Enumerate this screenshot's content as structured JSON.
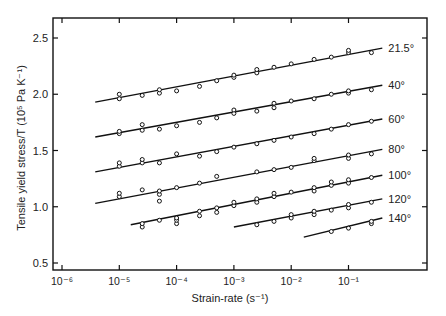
{
  "chart_data": {
    "type": "line",
    "title": "",
    "xlabel": "Strain-rate (s⁻¹)",
    "ylabel": "Tensile yield stress/T (10⁵ Pa K⁻¹)",
    "xscale": "log",
    "xlim_log10": [
      -6.0,
      0.38
    ],
    "ylim": [
      0.45,
      2.67
    ],
    "x_ticks_log10": [
      -6,
      -5,
      -4,
      -3,
      -2,
      -1
    ],
    "x_tick_labels": [
      "10⁻⁶",
      "10⁻⁵",
      "10⁻⁴",
      "10⁻³",
      "10⁻²",
      "10⁻¹"
    ],
    "y_ticks": [
      0.5,
      1.0,
      1.5,
      2.0,
      2.5
    ],
    "y_tick_labels": [
      "0.5",
      "1.0",
      "1.5",
      "2.0",
      "2.5"
    ],
    "grid": false,
    "legend_position": "inline labels at right end of each line",
    "series": [
      {
        "name": "21.5°",
        "fit_line": {
          "x_log10": [
            -5.42,
            -0.41
          ],
          "y": [
            1.93,
            2.41
          ]
        },
        "points": [
          [
            -5.0,
            1.96
          ],
          [
            -5.0,
            2.0
          ],
          [
            -4.6,
            1.99
          ],
          [
            -4.3,
            2.01
          ],
          [
            -4.3,
            2.04
          ],
          [
            -4.0,
            2.03
          ],
          [
            -3.6,
            2.07
          ],
          [
            -3.3,
            2.12
          ],
          [
            -3.0,
            2.15
          ],
          [
            -3.0,
            2.17
          ],
          [
            -2.6,
            2.19
          ],
          [
            -2.6,
            2.22
          ],
          [
            -2.3,
            2.24
          ],
          [
            -2.0,
            2.27
          ],
          [
            -1.6,
            2.31
          ],
          [
            -1.3,
            2.33
          ],
          [
            -1.0,
            2.37
          ],
          [
            -1.0,
            2.39
          ],
          [
            -0.6,
            2.37
          ]
        ]
      },
      {
        "name": "40°",
        "fit_line": {
          "x_log10": [
            -5.42,
            -0.41
          ],
          "y": [
            1.62,
            2.08
          ]
        },
        "points": [
          [
            -5.0,
            1.65
          ],
          [
            -5.0,
            1.67
          ],
          [
            -4.6,
            1.73
          ],
          [
            -4.6,
            1.68
          ],
          [
            -4.3,
            1.69
          ],
          [
            -4.0,
            1.72
          ],
          [
            -3.6,
            1.75
          ],
          [
            -3.3,
            1.79
          ],
          [
            -3.0,
            1.83
          ],
          [
            -3.0,
            1.86
          ],
          [
            -2.6,
            1.85
          ],
          [
            -2.3,
            1.88
          ],
          [
            -2.3,
            1.92
          ],
          [
            -2.0,
            1.94
          ],
          [
            -1.6,
            1.96
          ],
          [
            -1.3,
            2.0
          ],
          [
            -1.0,
            2.01
          ],
          [
            -1.0,
            2.03
          ],
          [
            -0.6,
            2.04
          ]
        ]
      },
      {
        "name": "60°",
        "fit_line": {
          "x_log10": [
            -5.42,
            -0.41
          ],
          "y": [
            1.31,
            1.78
          ]
        },
        "points": [
          [
            -5.0,
            1.36
          ],
          [
            -5.0,
            1.39
          ],
          [
            -4.6,
            1.39
          ],
          [
            -4.6,
            1.42
          ],
          [
            -4.3,
            1.39
          ],
          [
            -4.0,
            1.47
          ],
          [
            -3.6,
            1.45
          ],
          [
            -3.3,
            1.49
          ],
          [
            -3.0,
            1.53
          ],
          [
            -2.6,
            1.56
          ],
          [
            -2.3,
            1.59
          ],
          [
            -2.0,
            1.62
          ],
          [
            -1.6,
            1.65
          ],
          [
            -1.3,
            1.69
          ],
          [
            -1.0,
            1.73
          ],
          [
            -0.6,
            1.76
          ]
        ]
      },
      {
        "name": "80°",
        "fit_line": {
          "x_log10": [
            -5.42,
            -0.41
          ],
          "y": [
            1.03,
            1.51
          ]
        },
        "points": [
          [
            -5.0,
            1.09
          ],
          [
            -5.0,
            1.12
          ],
          [
            -4.6,
            1.15
          ],
          [
            -4.3,
            1.11
          ],
          [
            -4.3,
            1.14
          ],
          [
            -4.3,
            1.05
          ],
          [
            -4.0,
            1.17
          ],
          [
            -3.6,
            1.21
          ],
          [
            -3.3,
            1.27
          ],
          [
            -2.6,
            1.31
          ],
          [
            -2.3,
            1.33
          ],
          [
            -2.0,
            1.35
          ],
          [
            -1.6,
            1.41
          ],
          [
            -1.6,
            1.43
          ],
          [
            -1.0,
            1.43
          ],
          [
            -1.0,
            1.46
          ],
          [
            -0.6,
            1.47
          ]
        ]
      },
      {
        "name": "100°",
        "fit_line": {
          "x_log10": [
            -4.8,
            -0.41
          ],
          "y": [
            0.84,
            1.28
          ]
        },
        "points": [
          [
            -4.6,
            0.82
          ],
          [
            -4.6,
            0.85
          ],
          [
            -4.3,
            0.88
          ],
          [
            -4.0,
            0.85
          ],
          [
            -4.0,
            0.88
          ],
          [
            -4.0,
            0.9
          ],
          [
            -3.6,
            0.92
          ],
          [
            -3.6,
            0.96
          ],
          [
            -3.3,
            0.95
          ],
          [
            -3.3,
            0.99
          ],
          [
            -3.0,
            1.01
          ],
          [
            -3.0,
            1.04
          ],
          [
            -2.6,
            1.04
          ],
          [
            -2.6,
            1.07
          ],
          [
            -2.3,
            1.09
          ],
          [
            -2.3,
            1.12
          ],
          [
            -2.0,
            1.13
          ],
          [
            -1.6,
            1.14
          ],
          [
            -1.6,
            1.17
          ],
          [
            -1.3,
            1.19
          ],
          [
            -1.3,
            1.22
          ],
          [
            -1.0,
            1.21
          ],
          [
            -1.0,
            1.24
          ],
          [
            -0.6,
            1.26
          ]
        ]
      },
      {
        "name": "120°",
        "fit_line": {
          "x_log10": [
            -3.0,
            -0.41
          ],
          "y": [
            0.82,
            1.07
          ]
        },
        "points": [
          [
            -2.6,
            0.84
          ],
          [
            -2.3,
            0.87
          ],
          [
            -2.0,
            0.9
          ],
          [
            -2.0,
            0.93
          ],
          [
            -1.6,
            0.93
          ],
          [
            -1.6,
            0.96
          ],
          [
            -1.3,
            0.97
          ],
          [
            -1.0,
            0.99
          ],
          [
            -1.0,
            1.02
          ],
          [
            -0.6,
            1.04
          ]
        ]
      },
      {
        "name": "140°",
        "fit_line": {
          "x_log10": [
            -1.78,
            -0.41
          ],
          "y": [
            0.73,
            0.9
          ]
        },
        "points": [
          [
            -1.3,
            0.78
          ],
          [
            -1.0,
            0.81
          ],
          [
            -0.6,
            0.85
          ],
          [
            -0.6,
            0.87
          ]
        ]
      }
    ]
  }
}
